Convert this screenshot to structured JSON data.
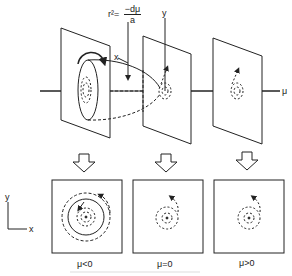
{
  "equation": {
    "lhs": "r²=",
    "numerator": "−dμ",
    "denominator": "a"
  },
  "axes_3d": {
    "x_label": "x",
    "y_label": "y",
    "mu_label": "μ"
  },
  "axes_2d": {
    "x_label": "x",
    "y_label": "y"
  },
  "panels": [
    {
      "label": "μ<0",
      "state": "stable limit cycle with spirals"
    },
    {
      "label": "μ=0",
      "state": "spiral"
    },
    {
      "label": "μ>0",
      "state": "spiral"
    }
  ],
  "colors": {
    "line": "#222222",
    "background": "#ffffff"
  }
}
